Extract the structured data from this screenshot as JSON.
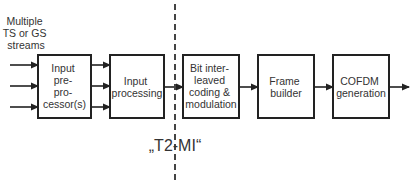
{
  "diagram": {
    "input_label": [
      "Multiple",
      "TS or GS",
      "streams"
    ],
    "blocks": [
      {
        "id": "input-preprocessor",
        "lines": [
          "Input",
          "pre-",
          "pro-",
          "cessor(s)"
        ]
      },
      {
        "id": "input-processing",
        "lines": [
          "Input",
          "processing"
        ]
      },
      {
        "id": "bicm",
        "lines": [
          "Bit inter-",
          "leaved",
          "coding &",
          "modulation"
        ]
      },
      {
        "id": "frame-builder",
        "lines": [
          "Frame",
          "builder"
        ]
      },
      {
        "id": "cofdm-generation",
        "lines": [
          "COFDM",
          "generation"
        ]
      }
    ],
    "interface_label": "„T2-MI“",
    "colors": {
      "stroke": "#222222",
      "text": "#333333",
      "background": "#ffffff"
    }
  }
}
